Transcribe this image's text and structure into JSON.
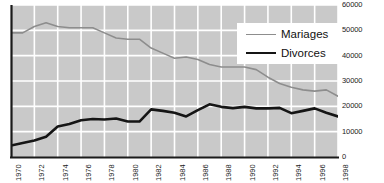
{
  "chart_data": {
    "type": "line",
    "title": "",
    "xlabel": "",
    "ylabel": "",
    "x": [
      1970,
      1971,
      1972,
      1973,
      1974,
      1975,
      1976,
      1977,
      1978,
      1979,
      1980,
      1981,
      1982,
      1983,
      1984,
      1985,
      1986,
      1987,
      1988,
      1989,
      1990,
      1991,
      1992,
      1993,
      1994,
      1995,
      1996,
      1997,
      1998
    ],
    "xlim": [
      1970,
      1998
    ],
    "ylim": [
      0,
      60000
    ],
    "grid": true,
    "legend_position": "top-right",
    "xtick_labels": [
      "1970",
      "1972",
      "1974",
      "1976",
      "1978",
      "1980",
      "1982",
      "1984",
      "1986",
      "1988",
      "1990",
      "1992",
      "1994",
      "1996",
      "1998"
    ],
    "xtick_values": [
      1970,
      1972,
      1974,
      1976,
      1978,
      1980,
      1982,
      1984,
      1986,
      1988,
      1990,
      1992,
      1994,
      1996,
      1998
    ],
    "ytick_labels": [
      "0",
      "10000",
      "20000",
      "30000",
      "40000",
      "50000",
      "60000"
    ],
    "ytick_values": [
      0,
      10000,
      20000,
      30000,
      40000,
      50000,
      60000
    ],
    "series": [
      {
        "name": "Mariages",
        "color": "#8d8d8d",
        "width": 1.6,
        "values": [
          49000,
          49000,
          51500,
          53000,
          51500,
          51000,
          51000,
          51000,
          49000,
          47000,
          46500,
          46500,
          43000,
          41000,
          39000,
          39500,
          38500,
          36500,
          35500,
          35500,
          35500,
          34500,
          31500,
          29000,
          27500,
          26500,
          26000,
          26500,
          24000
        ]
      },
      {
        "name": "Divorces",
        "color": "#151515",
        "width": 2.6,
        "values": [
          4500,
          5500,
          6500,
          8000,
          12000,
          13000,
          14500,
          15000,
          14800,
          15200,
          14000,
          14000,
          18800,
          18200,
          17500,
          16000,
          18500,
          20800,
          19800,
          19300,
          19800,
          19200,
          19200,
          19400,
          17300,
          18200,
          19200,
          17500,
          16000
        ]
      }
    ]
  },
  "legend": {
    "items": [
      {
        "label": "Mariages"
      },
      {
        "label": "Divorces"
      }
    ]
  },
  "axes": {
    "y_labels": [
      "60000",
      "50000",
      "40000",
      "30000",
      "20000",
      "10000",
      "0"
    ],
    "x_labels": [
      "1970",
      "1972",
      "1974",
      "1976",
      "1978",
      "1980",
      "1982",
      "1984",
      "1986",
      "1988",
      "1990",
      "1992",
      "1994",
      "1996",
      "1998"
    ]
  },
  "colors": {
    "plot_background": "#c9c9c9",
    "grid": "#ffffff",
    "axis": "#1a1a1a",
    "mariages": "#8d8d8d",
    "divorces": "#151515",
    "legend_background": "#ffffff",
    "text": "#1b1b1b"
  }
}
